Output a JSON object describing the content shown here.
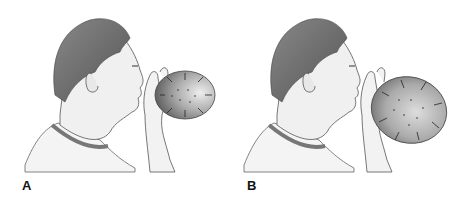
{
  "figure": {
    "panels": [
      {
        "label": "A",
        "balloon": "small, oval",
        "arrows": "outward pressure arrows"
      },
      {
        "label": "B",
        "balloon": "larger, inflated",
        "arrows": "outward pressure arrows"
      }
    ],
    "colors": {
      "balloon_dark": "#555555",
      "balloon_light": "#d8d8d8",
      "hair": "#6b6b6b",
      "skin_line": "#444444",
      "collar": "#7a7a7a"
    }
  }
}
